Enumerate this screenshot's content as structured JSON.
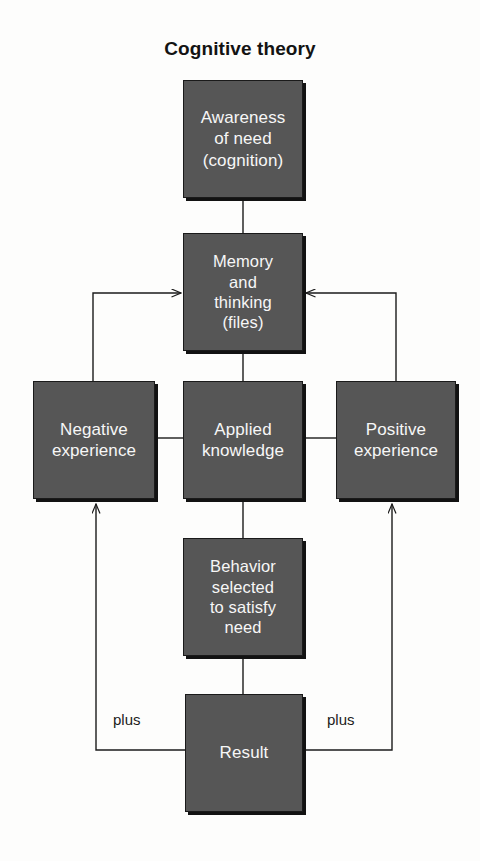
{
  "diagram": {
    "title": "Cognitive theory",
    "colors": {
      "box_fill": "#565656",
      "box_border": "#1a1a1a",
      "box_shadow": "#121212",
      "text": "#ffffff",
      "line": "#1b1b1b",
      "background": "#fdfdfc"
    },
    "nodes": [
      {
        "id": "awareness",
        "label": "Awareness\nof need\n(cognition)",
        "x": 183,
        "y": 80,
        "w": 120,
        "h": 118
      },
      {
        "id": "memory",
        "label": "Memory\nand\nthinking\n(files)",
        "x": 183,
        "y": 233,
        "w": 120,
        "h": 118
      },
      {
        "id": "negative",
        "label": "Negative\nexperience",
        "x": 33,
        "y": 381,
        "w": 122,
        "h": 118
      },
      {
        "id": "applied",
        "label": "Applied\nknowledge",
        "x": 183,
        "y": 381,
        "w": 120,
        "h": 118
      },
      {
        "id": "positive",
        "label": "Positive\nexperience",
        "x": 336,
        "y": 381,
        "w": 120,
        "h": 118
      },
      {
        "id": "behavior",
        "label": "Behavior\nselected\nto satisfy\nneed",
        "x": 183,
        "y": 538,
        "w": 120,
        "h": 118
      },
      {
        "id": "result",
        "label": "Result",
        "x": 185,
        "y": 694,
        "w": 118,
        "h": 118
      }
    ],
    "edge_labels": [
      {
        "id": "plus-left",
        "text": "plus",
        "x": 113,
        "y": 711
      },
      {
        "id": "plus-right",
        "text": "plus",
        "x": 327,
        "y": 711
      }
    ],
    "edges": [
      {
        "id": "awareness-to-memory",
        "from": "awareness",
        "to": "memory",
        "arrow": false
      },
      {
        "id": "memory-to-applied",
        "from": "memory",
        "to": "applied",
        "arrow": false
      },
      {
        "id": "applied-to-negative",
        "from": "applied",
        "to": "negative",
        "arrow": false
      },
      {
        "id": "applied-to-positive",
        "from": "applied",
        "to": "positive",
        "arrow": false
      },
      {
        "id": "applied-to-behavior",
        "from": "applied",
        "to": "behavior",
        "arrow": false
      },
      {
        "id": "behavior-to-result",
        "from": "behavior",
        "to": "result",
        "arrow": false
      },
      {
        "id": "negative-to-memory",
        "from": "negative",
        "to": "memory",
        "arrow": true
      },
      {
        "id": "positive-to-memory",
        "from": "positive",
        "to": "memory",
        "arrow": true
      },
      {
        "id": "result-to-negative",
        "from": "result",
        "to": "negative",
        "arrow": true,
        "label": "plus"
      },
      {
        "id": "result-to-positive",
        "from": "result",
        "to": "positive",
        "arrow": true,
        "label": "plus"
      }
    ]
  }
}
